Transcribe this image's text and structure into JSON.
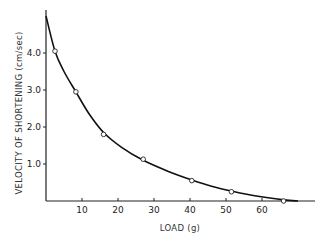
{
  "chart_data": {
    "type": "line",
    "title": "",
    "xlabel": "LOAD (g)",
    "ylabel": "VELOCITY OF SHORTENING (cm/sec)",
    "xlim": [
      0,
      75
    ],
    "ylim": [
      0,
      5.2
    ],
    "grid": false,
    "legend": null,
    "x_ticks": [
      10,
      20,
      30,
      40,
      50,
      60
    ],
    "x_tick_labels": [
      "10",
      "20",
      "30",
      "40",
      "50",
      "60"
    ],
    "y_ticks": [
      1.0,
      2.0,
      3.0,
      4.0
    ],
    "y_tick_labels": [
      "1.0",
      "2.0",
      "3.0",
      "4.0"
    ],
    "series": [
      {
        "name": "measured",
        "style": "open-circle markers",
        "x": [
          2.5,
          8.3,
          16,
          27,
          40.5,
          51.5,
          66
        ],
        "y": [
          4.05,
          2.95,
          1.8,
          1.13,
          0.55,
          0.25,
          0.0
        ]
      },
      {
        "name": "fitted curve",
        "style": "solid line",
        "x": [
          0,
          2.5,
          5,
          8.3,
          12,
          16,
          21,
          27,
          34,
          40.5,
          46,
          51.5,
          58,
          66,
          70
        ],
        "y": [
          5.0,
          4.05,
          3.5,
          2.95,
          2.35,
          1.85,
          1.45,
          1.1,
          0.8,
          0.57,
          0.4,
          0.27,
          0.14,
          0.03,
          0.0
        ]
      }
    ]
  },
  "axes": {
    "x_title": "LOAD (g)",
    "y_title": "VELOCITY OF SHORTENING (cm/sec)"
  }
}
